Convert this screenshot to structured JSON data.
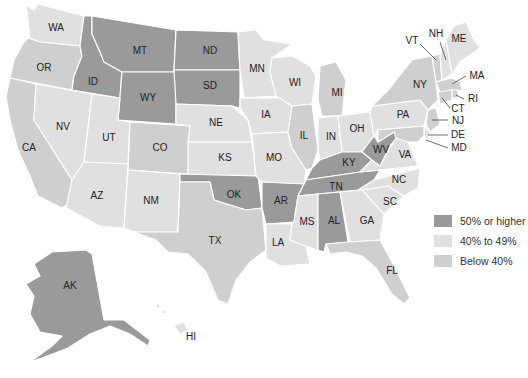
{
  "colors": {
    "high": "#9a9a9a",
    "mid": "#e0e0e0",
    "low": "#cfcfcf",
    "background": "#ffffff",
    "border": "#ffffff"
  },
  "legend": [
    {
      "label": "50% or higher",
      "category": "high",
      "color": "#9a9a9a"
    },
    {
      "label": "40% to 49%",
      "category": "mid",
      "color": "#e0e0e0"
    },
    {
      "label": "Below 40%",
      "category": "low",
      "color": "#cfcfcf"
    }
  ],
  "states": [
    {
      "abbr": "WA",
      "category": "mid"
    },
    {
      "abbr": "OR",
      "category": "low"
    },
    {
      "abbr": "CA",
      "category": "low"
    },
    {
      "abbr": "ID",
      "category": "high"
    },
    {
      "abbr": "NV",
      "category": "mid"
    },
    {
      "abbr": "MT",
      "category": "high"
    },
    {
      "abbr": "WY",
      "category": "high"
    },
    {
      "abbr": "UT",
      "category": "mid"
    },
    {
      "abbr": "AZ",
      "category": "mid"
    },
    {
      "abbr": "CO",
      "category": "low"
    },
    {
      "abbr": "NM",
      "category": "mid"
    },
    {
      "abbr": "ND",
      "category": "high"
    },
    {
      "abbr": "SD",
      "category": "high"
    },
    {
      "abbr": "NE",
      "category": "mid"
    },
    {
      "abbr": "KS",
      "category": "mid"
    },
    {
      "abbr": "OK",
      "category": "high"
    },
    {
      "abbr": "TX",
      "category": "low"
    },
    {
      "abbr": "MN",
      "category": "mid"
    },
    {
      "abbr": "IA",
      "category": "mid"
    },
    {
      "abbr": "MO",
      "category": "mid"
    },
    {
      "abbr": "AR",
      "category": "high"
    },
    {
      "abbr": "LA",
      "category": "mid"
    },
    {
      "abbr": "WI",
      "category": "mid"
    },
    {
      "abbr": "IL",
      "category": "low"
    },
    {
      "abbr": "MI",
      "category": "low"
    },
    {
      "abbr": "IN",
      "category": "mid"
    },
    {
      "abbr": "OH",
      "category": "mid"
    },
    {
      "abbr": "KY",
      "category": "high"
    },
    {
      "abbr": "TN",
      "category": "high"
    },
    {
      "abbr": "MS",
      "category": "mid"
    },
    {
      "abbr": "AL",
      "category": "high"
    },
    {
      "abbr": "GA",
      "category": "mid"
    },
    {
      "abbr": "FL",
      "category": "low"
    },
    {
      "abbr": "SC",
      "category": "mid"
    },
    {
      "abbr": "NC",
      "category": "mid"
    },
    {
      "abbr": "VA",
      "category": "mid"
    },
    {
      "abbr": "WV",
      "category": "high"
    },
    {
      "abbr": "PA",
      "category": "mid"
    },
    {
      "abbr": "NY",
      "category": "low"
    },
    {
      "abbr": "VT",
      "category": "low"
    },
    {
      "abbr": "NH",
      "category": "mid"
    },
    {
      "abbr": "ME",
      "category": "mid"
    },
    {
      "abbr": "MA",
      "category": "low"
    },
    {
      "abbr": "RI",
      "category": "low"
    },
    {
      "abbr": "CT",
      "category": "low"
    },
    {
      "abbr": "NJ",
      "category": "low"
    },
    {
      "abbr": "DE",
      "category": "mid"
    },
    {
      "abbr": "MD",
      "category": "low"
    },
    {
      "abbr": "AK",
      "category": "high"
    },
    {
      "abbr": "HI",
      "category": "mid"
    }
  ]
}
